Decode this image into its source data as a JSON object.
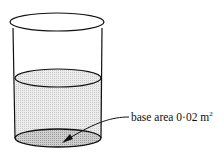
{
  "diagram": {
    "label": {
      "text": "base area 0·02 m",
      "superscript": "2"
    },
    "colors": {
      "outline": "#111111",
      "liquid_fill": "#e2e2e2",
      "base_fill": "#bdbdbd"
    }
  }
}
